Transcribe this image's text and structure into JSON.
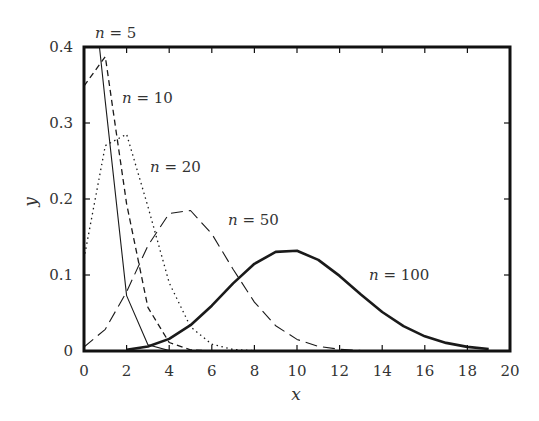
{
  "chart_data": {
    "type": "line",
    "title": "",
    "xlabel": "x",
    "ylabel": "y",
    "xlim": [
      0,
      20
    ],
    "ylim": [
      0,
      0.4
    ],
    "xticks": [
      0,
      2,
      4,
      6,
      8,
      10,
      12,
      14,
      16,
      18,
      20
    ],
    "xtick_labels": [
      "0",
      "2",
      "4",
      "6",
      "8",
      "10",
      "12",
      "14",
      "16",
      "18",
      "20"
    ],
    "yticks": [
      0,
      0.1,
      0.2,
      0.3,
      0.4
    ],
    "ytick_labels": [
      "0",
      "0.1",
      "0.2",
      "0.3",
      "0.4"
    ],
    "grid": false,
    "legend": "inline labels",
    "series": [
      {
        "name": "n = 5",
        "label_var": "n",
        "label_val": "5",
        "style": "solid-thin",
        "x": [
          0,
          1,
          2,
          3,
          4,
          5
        ],
        "values": [
          0.5905,
          0.3281,
          0.0729,
          0.0081,
          0.0005,
          0.0
        ]
      },
      {
        "name": "n = 10",
        "label_var": "n",
        "label_val": "10",
        "style": "short-dash",
        "x": [
          0,
          1,
          2,
          3,
          4,
          5,
          6
        ],
        "values": [
          0.3487,
          0.3874,
          0.1937,
          0.0574,
          0.0112,
          0.0015,
          0.0001
        ]
      },
      {
        "name": "n = 20",
        "label_var": "n",
        "label_val": "20",
        "style": "dotted",
        "x": [
          0,
          1,
          2,
          3,
          4,
          5,
          6,
          7,
          8
        ],
        "values": [
          0.1216,
          0.2702,
          0.2852,
          0.1901,
          0.0898,
          0.0319,
          0.0089,
          0.002,
          0.0004
        ]
      },
      {
        "name": "n = 50",
        "label_var": "n",
        "label_val": "50",
        "style": "long-dash",
        "x": [
          0,
          1,
          2,
          3,
          4,
          5,
          6,
          7,
          8,
          9,
          10,
          11,
          12,
          13,
          14
        ],
        "values": [
          0.0052,
          0.0286,
          0.0779,
          0.1386,
          0.1809,
          0.1849,
          0.1541,
          0.1076,
          0.0643,
          0.0333,
          0.0152,
          0.0061,
          0.0022,
          0.0007,
          0.0002
        ]
      },
      {
        "name": "n = 100",
        "label_var": "n",
        "label_val": "100",
        "style": "solid-thick",
        "x": [
          2,
          3,
          4,
          5,
          6,
          7,
          8,
          9,
          10,
          11,
          12,
          13,
          14,
          15,
          16,
          17,
          18,
          19
        ],
        "values": [
          0.0016,
          0.0059,
          0.0159,
          0.0339,
          0.0596,
          0.0889,
          0.1148,
          0.1304,
          0.1319,
          0.1199,
          0.0988,
          0.0743,
          0.0513,
          0.0327,
          0.0193,
          0.0106,
          0.0054,
          0.0026
        ]
      }
    ],
    "annotations": [
      {
        "text": "n = 5",
        "x": 95,
        "y": 38
      },
      {
        "text": "n = 10",
        "x": 122,
        "y": 103
      },
      {
        "text": "n = 20",
        "x": 150,
        "y": 172
      },
      {
        "text": "n = 50",
        "x": 228,
        "y": 225
      },
      {
        "text": "n = 100",
        "x": 369,
        "y": 280
      }
    ]
  }
}
